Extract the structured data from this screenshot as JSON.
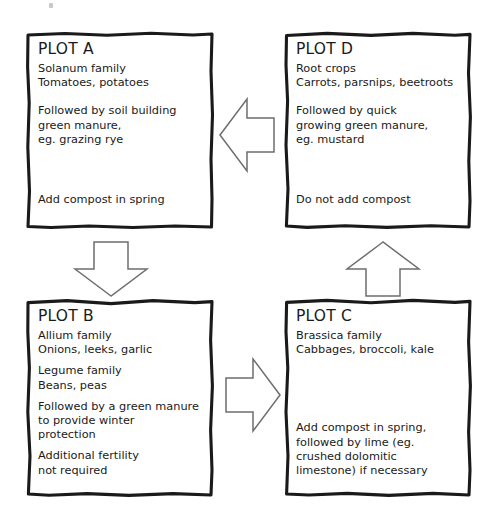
{
  "diagram": {
    "style": {
      "background": "#ffffff",
      "ink": "#1a1a1a",
      "arrow_stroke": "#6e6e6e"
    }
  },
  "plots": [
    {
      "id": "a",
      "title": "PLOT A",
      "crop_family": "Solanum family",
      "crops": "Tomatoes, potatoes",
      "follow_on": "Followed by soil building\ngreen manure,\neg. grazing rye",
      "compost_note": "Add compost in spring"
    },
    {
      "id": "d",
      "title": "PLOT D",
      "crop_family": "Root crops",
      "crops": "Carrots, parsnips, beetroots",
      "follow_on": "Followed by quick\ngrowing green manure,\neg. mustard",
      "compost_note": "Do not add compost"
    },
    {
      "id": "b",
      "title": "PLOT B",
      "crop_family": "Allium family",
      "crops": "Onions, leeks, garlic",
      "crop_family_2": "Legume family",
      "crops_2": "Beans, peas",
      "follow_on": "Followed by a green manure\nto provide winter\nprotection",
      "compost_note": "Additional fertility\nnot required"
    },
    {
      "id": "c",
      "title": "PLOT C",
      "crop_family": "Brassica family",
      "crops": "Cabbages, broccoli, kale",
      "compost_note": "Add compost in spring,\nfollowed by lime (eg.\ncrushed dolomitic\nlimestone) if necessary"
    }
  ],
  "arrows": [
    {
      "id": "d-to-a",
      "from": "PLOT D",
      "to": "PLOT A",
      "direction": "left",
      "icon": "arrow-left-icon"
    },
    {
      "id": "a-to-b",
      "from": "PLOT A",
      "to": "PLOT B",
      "direction": "down",
      "icon": "arrow-down-icon"
    },
    {
      "id": "b-to-c",
      "from": "PLOT B",
      "to": "PLOT C",
      "direction": "right",
      "icon": "arrow-right-icon"
    },
    {
      "id": "c-to-d",
      "from": "PLOT C",
      "to": "PLOT D",
      "direction": "up",
      "icon": "arrow-up-icon"
    }
  ]
}
